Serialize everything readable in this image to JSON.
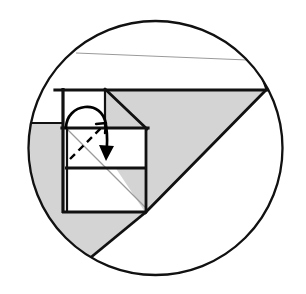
{
  "figure": {
    "title": "Paper folding construction inside a circle",
    "type": "geometric-fold-diagram",
    "canvas": {
      "width": 306,
      "height": 294,
      "background": "#ffffff"
    },
    "colors": {
      "outline": "#111111",
      "shade_gray": "#d4d4d4",
      "shade_gray_edge": "#8d8d8d",
      "thin_gray_line": "#9a9a9a",
      "white": "#ffffff",
      "arrow": "#000000",
      "dashed": "#000000"
    },
    "stroke_widths": {
      "circle": 2.2,
      "heavy": 3.0,
      "medium": 2.2,
      "thin": 1.1,
      "arrow": 2.6,
      "dashed": 2.2
    },
    "circle": {
      "cx": 155.5,
      "cy": 148,
      "r": 127
    },
    "shapes": [
      {
        "name": "upper-white-band",
        "fill": "#ffffff",
        "points": "49,78 262,78 266,90 56,90"
      },
      {
        "name": "large-gray-triangle-right",
        "fill": "#d4d4d4",
        "points": "63,89 266,89 145,212"
      },
      {
        "name": "lower-left-gray-block",
        "fill": "#d4d4d4",
        "points": "32,123 63,123 63,212 36,212"
      },
      {
        "name": "bottom-gray-triangle",
        "fill": "#d4d4d4",
        "points": "36,212 145,212 84,262"
      },
      {
        "name": "white-inner-square-top",
        "fill": "#ffffff",
        "points": "63,89 105,89 105,128 63,128"
      },
      {
        "name": "white-mid-rectangle",
        "fill": "#ffffff",
        "points": "66,128 146,128 146,168 66,168"
      }
    ],
    "lines": [
      {
        "name": "thin-gray-top-chord",
        "x1": 76,
        "y1": 53,
        "x2": 272,
        "y2": 61,
        "stroke": "#9a9a9a",
        "width": 1.1
      },
      {
        "name": "thin-gray-diagonal",
        "x1": 64,
        "y1": 126,
        "x2": 146,
        "y2": 208,
        "stroke": "#9a9a9a",
        "width": 1.1
      },
      {
        "name": "heavy-top-edge",
        "x1": 56,
        "y1": 90,
        "x2": 266,
        "y2": 90,
        "stroke": "#111111",
        "width": 3.0
      },
      {
        "name": "triangle-hypotenuse",
        "x1": 266,
        "y1": 89,
        "x2": 145,
        "y2": 212,
        "stroke": "#111111",
        "width": 2.6
      },
      {
        "name": "small-square-diagonal",
        "x1": 105,
        "y1": 89,
        "x2": 146,
        "y2": 128,
        "stroke": "#111111",
        "width": 2.6
      },
      {
        "name": "small-square-right-edge",
        "x1": 105,
        "y1": 89,
        "x2": 105,
        "y2": 128,
        "stroke": "#111111",
        "width": 2.2
      },
      {
        "name": "square-left-edge",
        "x1": 63,
        "y1": 88,
        "x2": 63,
        "y2": 213,
        "stroke": "#111111",
        "width": 3.0
      },
      {
        "name": "inner-left-edge",
        "x1": 67,
        "y1": 128,
        "x2": 67,
        "y2": 212,
        "stroke": "#111111",
        "width": 2.2
      },
      {
        "name": "mid-horizontal-upper",
        "x1": 63,
        "y1": 128,
        "x2": 148,
        "y2": 128,
        "stroke": "#111111",
        "width": 3.0
      },
      {
        "name": "mid-horizontal-lower",
        "x1": 66,
        "y1": 168,
        "x2": 147,
        "y2": 168,
        "stroke": "#111111",
        "width": 2.6
      },
      {
        "name": "square-right-edge",
        "x1": 146,
        "y1": 128,
        "x2": 146,
        "y2": 212,
        "stroke": "#111111",
        "width": 2.6
      },
      {
        "name": "square-bottom-edge",
        "x1": 63,
        "y1": 212,
        "x2": 147,
        "y2": 212,
        "stroke": "#111111",
        "width": 2.6
      },
      {
        "name": "gray-block-top-edge",
        "x1": 31,
        "y1": 123,
        "x2": 63,
        "y2": 123,
        "stroke": "#111111",
        "width": 2.2
      },
      {
        "name": "bottom-triangle-left-edge",
        "x1": 36,
        "y1": 212,
        "x2": 84,
        "y2": 262,
        "stroke": "#111111",
        "width": 2.2
      },
      {
        "name": "bottom-triangle-right-edge",
        "x1": 84,
        "y1": 262,
        "x2": 145,
        "y2": 212,
        "stroke": "#111111",
        "width": 2.6
      },
      {
        "name": "upper-band-right-edge",
        "x1": 262,
        "y1": 78,
        "x2": 266,
        "y2": 90,
        "stroke": "#111111",
        "width": 2.2
      }
    ],
    "dashed_line": {
      "name": "fold-crease-dashed",
      "path": "M 71,158 L 106,123",
      "dash_pattern": "7,5",
      "stroke": "#000000",
      "width": 2.4
    },
    "dashed_arrowhead": {
      "name": "dashed-arrowhead",
      "points": "106,123 97,124 104,132",
      "stroke": "#000000"
    },
    "fold_arrow": {
      "name": "fold-direction-arrow",
      "path": "M 67,127 C 68,104 102,100 105,124 C 107,140 107,148 106,155",
      "stroke": "#000000",
      "width": 2.6,
      "arrowhead": "100,146 106,160 113,147"
    }
  }
}
